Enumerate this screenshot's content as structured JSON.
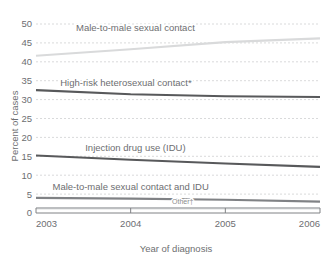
{
  "chart_data": {
    "type": "line",
    "title": "",
    "xlabel": "Year of diagnosis",
    "ylabel": "Percent of cases",
    "x": [
      2003,
      2004,
      2005,
      2006
    ],
    "categories": [
      "2003",
      "2004",
      "2005",
      "2006"
    ],
    "xlim": [
      2003,
      2006
    ],
    "ylim": [
      0,
      50
    ],
    "yticks": [
      0,
      5,
      10,
      15,
      20,
      25,
      30,
      35,
      40,
      45,
      50
    ],
    "ytick_labels": [
      "0",
      "5",
      "10",
      "15",
      "20",
      "25",
      "30",
      "35",
      "40",
      "45",
      "50"
    ],
    "xticks": [
      2003,
      2004,
      2005,
      2006
    ],
    "xtick_labels": [
      "2003",
      "2004",
      "2005",
      "2006"
    ],
    "grid": "horizontal-dashed",
    "legend": "inline-labels-above-lines",
    "series": [
      {
        "name": "Male-to-male sexual contact",
        "label": "Male-to-male sexual contact",
        "color": "#d9dadb",
        "values": [
          41.6,
          43.3,
          45.2,
          46.2
        ],
        "label_x": 2004.05,
        "label_y": 48.2
      },
      {
        "name": "High-risk heterosexual contact*",
        "label": "High-risk heterosexual contact*",
        "color": "#58595b",
        "values": [
          32.5,
          31.4,
          30.9,
          30.7
        ],
        "label_x": 2003.95,
        "label_y": 33.6
      },
      {
        "name": "Injection drug use (IDU)",
        "label": "Injection drug use (IDU)",
        "color": "#58595b",
        "values": [
          15.2,
          14.1,
          13.1,
          12.2
        ],
        "label_x": 2004.05,
        "label_y": 16.3
      },
      {
        "name": "Male-to-male sexual contact and IDU",
        "label": "Male-to-male sexual contact and IDU",
        "color": "#808285",
        "values": [
          4.0,
          3.8,
          3.5,
          3.0
        ],
        "label_x": 2004.0,
        "label_y": 6.0
      },
      {
        "name": "Other",
        "label": "Other†",
        "color": "#bcbec0",
        "values": [
          1.3,
          1.3,
          1.3,
          1.3
        ],
        "label_x": 2004.55,
        "label_y": 2.3
      }
    ],
    "footnotes": [
      "*",
      "†"
    ]
  },
  "axes": {
    "y_title": "Percent of cases",
    "x_title": "Year of diagnosis"
  }
}
